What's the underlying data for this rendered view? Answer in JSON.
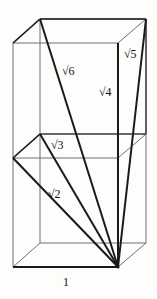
{
  "figure": {
    "background_color": "#fdfdfc",
    "stroke_color_thin": "#6f6f6f",
    "stroke_color_thick": "#1a1a1a",
    "label_color": "#111111",
    "apex_vertex": {
      "x": 118,
      "y": 267
    },
    "labels": [
      {
        "id": "sqrt6",
        "text": "√6",
        "x": 62,
        "y": 65
      },
      {
        "id": "sqrt5",
        "text": "√5",
        "x": 124,
        "y": 48
      },
      {
        "id": "sqrt4",
        "text": "√4",
        "x": 99,
        "y": 86
      },
      {
        "id": "sqrt3",
        "text": "√3",
        "x": 51,
        "y": 139
      },
      {
        "id": "sqrt2",
        "text": "√2",
        "x": 48,
        "y": 188
      },
      {
        "id": "unit",
        "text": "1",
        "x": 63,
        "y": 276
      }
    ],
    "box": {
      "front_top_left": {
        "x": 13,
        "y": 43
      },
      "front_top_right": {
        "x": 118,
        "y": 43
      },
      "front_bottom_left": {
        "x": 13,
        "y": 267
      },
      "front_bottom_right": {
        "x": 118,
        "y": 267
      },
      "back_top_left": {
        "x": 40,
        "y": 19
      },
      "back_top_right": {
        "x": 146,
        "y": 19
      },
      "back_bottom_left": {
        "x": 40,
        "y": 243
      },
      "back_bottom_right": {
        "x": 146,
        "y": 243
      },
      "mid_front_left": {
        "x": 13,
        "y": 158
      },
      "mid_front_right": {
        "x": 118,
        "y": 158
      },
      "mid_back_left": {
        "x": 40,
        "y": 134
      },
      "mid_back_right": {
        "x": 146,
        "y": 134
      }
    },
    "diagonals": [
      {
        "id": "sqrt2-line",
        "from": {
          "x": 13,
          "y": 158
        },
        "to": {
          "x": 118,
          "y": 267
        }
      },
      {
        "id": "sqrt3-line",
        "from": {
          "x": 40,
          "y": 134
        },
        "to": {
          "x": 118,
          "y": 267
        }
      },
      {
        "id": "sqrt6-line",
        "from": {
          "x": 40,
          "y": 19
        },
        "to": {
          "x": 118,
          "y": 267
        }
      },
      {
        "id": "sqrt4-line",
        "from": {
          "x": 118,
          "y": 43
        },
        "to": {
          "x": 118,
          "y": 267
        }
      },
      {
        "id": "sqrt5-line",
        "from": {
          "x": 146,
          "y": 19
        },
        "to": {
          "x": 118,
          "y": 267
        }
      }
    ]
  }
}
